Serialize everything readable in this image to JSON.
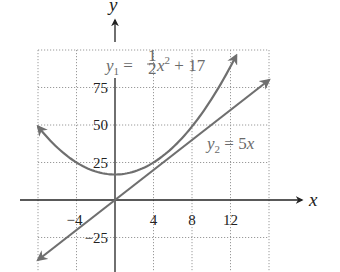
{
  "chart_data": {
    "type": "line",
    "title": "",
    "xlabel": "x",
    "ylabel": "y",
    "xlim": [
      -8,
      16
    ],
    "ylim": [
      -40,
      100
    ],
    "grid": true,
    "x_gridlines": [
      -8,
      -4,
      4,
      8,
      12,
      16
    ],
    "y_gridlines": [
      -25,
      25,
      50,
      75,
      100
    ],
    "x_ticks": [
      {
        "value": -4,
        "label": "−4"
      },
      {
        "value": 4,
        "label": "4"
      },
      {
        "value": 8,
        "label": "8"
      },
      {
        "value": 12,
        "label": "12"
      }
    ],
    "y_ticks": [
      {
        "value": 75,
        "label": "75"
      },
      {
        "value": 50,
        "label": "50"
      },
      {
        "value": 25,
        "label": "25"
      },
      {
        "value": -25,
        "label": "−25"
      }
    ],
    "series": [
      {
        "name": "y1",
        "formula": "y = 0.5x^2 + 17",
        "label_parts": {
          "var": "y",
          "sub": "1",
          "eq": " = ",
          "num": "1",
          "den": "2",
          "xvar": "x",
          "sup": "2",
          "rest": " + 17"
        },
        "x_range": [
          -8,
          12.6
        ],
        "arrows": "both",
        "color": "#6f6f6f"
      },
      {
        "name": "y2",
        "formula": "y = 5x",
        "label_parts": {
          "var": "y",
          "sub": "2",
          "eq": " = 5",
          "xvar": "x"
        },
        "x_range": [
          -8,
          16
        ],
        "arrows": "both",
        "color": "#6f6f6f"
      }
    ],
    "annotations": [
      {
        "text": "y1 = (1/2)x^2 + 17",
        "near": "top-center"
      },
      {
        "text": "y2 = 5x",
        "near": "right"
      }
    ]
  }
}
